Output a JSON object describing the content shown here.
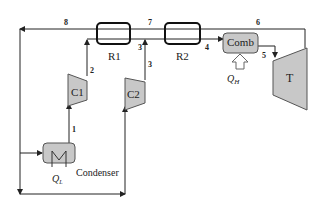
{
  "diagram": {
    "type": "thermodynamic-cycle-schematic",
    "components": {
      "r1": {
        "label": "R1"
      },
      "r2": {
        "label": "R2"
      },
      "c1": {
        "label": "C1"
      },
      "c2": {
        "label": "C2"
      },
      "comb": {
        "label": "Comb"
      },
      "turbine": {
        "label": "T"
      },
      "condenser": {
        "label": "Condenser"
      },
      "qh": {
        "label": "Q",
        "sub": "H"
      },
      "ql": {
        "label": "Q",
        "sub": "L"
      }
    },
    "state_points": [
      "1",
      "2",
      "3",
      "3",
      "4",
      "5",
      "6",
      "7",
      "8"
    ],
    "state_labels": {
      "s1": "1",
      "s2": "2",
      "s3a": "3",
      "s3b": "3",
      "s4": "4",
      "s5": "5",
      "s6": "6",
      "s7": "7",
      "s8": "8"
    },
    "colors": {
      "line": "#222222",
      "component_fill": "#c8c8c8",
      "component_stroke": "#555555",
      "recuperator_stroke": "#111111"
    }
  }
}
